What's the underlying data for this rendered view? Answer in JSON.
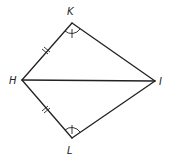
{
  "diagram": {
    "type": "geometry",
    "vertices": {
      "K": {
        "label": "K",
        "x": 72,
        "y": 23
      },
      "H": {
        "label": "H",
        "x": 22,
        "y": 80
      },
      "I": {
        "label": "I",
        "x": 155,
        "y": 81
      },
      "L": {
        "label": "L",
        "x": 72,
        "y": 138
      }
    },
    "labels": {
      "K": "K",
      "H": "H",
      "I": "I",
      "L": "L"
    },
    "segments": [
      "HK",
      "KI",
      "IL",
      "LH",
      "HI"
    ],
    "equal_sides": {
      "marking": "double-tick",
      "sides": [
        "HK",
        "HL"
      ]
    },
    "equal_angles": {
      "marking": "single-tick-arc",
      "angles": [
        "K",
        "L"
      ]
    },
    "colors": {
      "stroke": "#222222",
      "background": "#ffffff"
    }
  }
}
